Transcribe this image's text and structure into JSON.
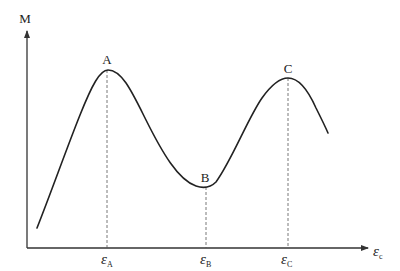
{
  "diagram": {
    "type": "moment-strain curve",
    "colors": {
      "curve": "#222222",
      "axis": "#333333",
      "guide": "#555555",
      "background": "#ffffff"
    },
    "axes": {
      "y_label": "M",
      "x_label_symbol": "ε",
      "x_label_subscript": "c"
    },
    "points": [
      {
        "id": "A",
        "label": "A",
        "tick_symbol": "ε",
        "tick_subscript": "A",
        "kind": "peak"
      },
      {
        "id": "B",
        "label": "B",
        "tick_symbol": "ε",
        "tick_subscript": "B",
        "kind": "trough"
      },
      {
        "id": "C",
        "label": "C",
        "tick_symbol": "ε",
        "tick_subscript": "C",
        "kind": "peak"
      }
    ]
  }
}
